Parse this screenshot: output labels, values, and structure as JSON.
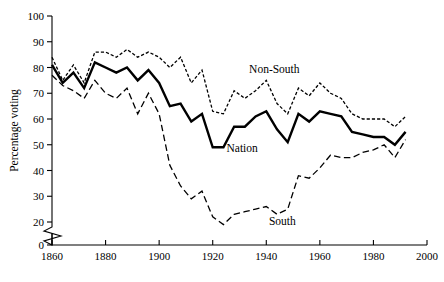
{
  "chart_data": {
    "type": "line",
    "title": "",
    "xlabel": "",
    "ylabel": "Percentage voting",
    "xlim": [
      1860,
      2000
    ],
    "ylim": [
      0,
      100
    ],
    "y_axis_break": true,
    "y_break_between": [
      0,
      20
    ],
    "grid": false,
    "legend": "inline-annotations",
    "xticks": [
      "1860",
      "1880",
      "1900",
      "1920",
      "1940",
      "1960",
      "1980",
      "2000"
    ],
    "xtick_values": [
      1860,
      1880,
      1900,
      1920,
      1940,
      1960,
      1980,
      2000
    ],
    "yticks": [
      "0",
      "20",
      "30",
      "40",
      "50",
      "60",
      "70",
      "80",
      "90",
      "100"
    ],
    "ytick_values": [
      0,
      20,
      30,
      40,
      50,
      60,
      70,
      80,
      90,
      100
    ],
    "x": [
      1860,
      1864,
      1868,
      1872,
      1876,
      1880,
      1884,
      1888,
      1892,
      1896,
      1900,
      1904,
      1908,
      1912,
      1916,
      1920,
      1924,
      1928,
      1932,
      1936,
      1940,
      1944,
      1948,
      1952,
      1956,
      1960,
      1964,
      1968,
      1972,
      1976,
      1980,
      1984,
      1988,
      1992
    ],
    "series": [
      {
        "name": "Non-South",
        "style": "dotted",
        "label_x": 1943,
        "label_y": 78,
        "values": [
          84,
          75,
          81,
          74,
          86,
          86,
          84,
          87,
          84,
          86,
          84,
          80,
          84,
          74,
          79,
          63,
          62,
          71,
          68,
          71,
          75,
          66,
          62,
          72,
          69,
          74,
          70,
          68,
          62,
          60,
          60,
          60,
          57,
          61
        ]
      },
      {
        "name": "Nation",
        "style": "solid-bold",
        "label_x": 1931,
        "label_y": 47,
        "values": [
          81,
          74,
          78,
          72,
          82,
          80,
          78,
          80,
          75,
          79,
          74,
          65,
          66,
          59,
          62,
          49,
          49,
          57,
          57,
          61,
          63,
          56,
          51,
          62,
          59,
          63,
          62,
          61,
          55,
          54,
          53,
          53,
          50,
          55
        ]
      },
      {
        "name": "South",
        "style": "dashed",
        "label_x": 1946,
        "label_y": 19,
        "values": [
          77,
          73,
          71,
          68,
          75,
          70,
          68,
          72,
          62,
          70,
          62,
          42,
          34,
          29,
          32,
          22,
          19,
          23,
          24,
          25,
          26,
          23,
          25,
          38,
          37,
          41,
          46,
          45,
          45,
          47,
          48,
          50,
          45,
          52
        ]
      }
    ],
    "annotations": [
      {
        "text": "Non-South",
        "x": 1943,
        "y": 78
      },
      {
        "text": "Nation",
        "x": 1931,
        "y": 47
      },
      {
        "text": "South",
        "x": 1946,
        "y": 19
      }
    ]
  }
}
